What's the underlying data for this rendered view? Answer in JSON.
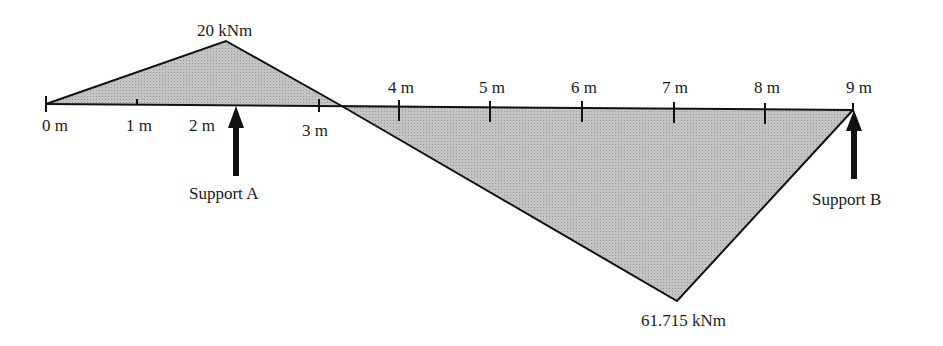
{
  "diagram": {
    "type": "bending-moment-diagram",
    "beam": {
      "start_m": 0,
      "end_m": 9,
      "tick_labels": [
        "0 m",
        "1 m",
        "2 m",
        "3 m",
        "4 m",
        "5 m",
        "6 m",
        "7 m",
        "8 m",
        "9 m"
      ]
    },
    "peaks": {
      "positive": {
        "label": "20 kNm",
        "value_kNm": 20
      },
      "negative": {
        "label": "61.715 kNm",
        "value_kNm": -61.715
      }
    },
    "supports": [
      {
        "label": "Support A"
      },
      {
        "label": "Support B"
      }
    ],
    "colors": {
      "fill": "#bdbdbd",
      "line": "#111111",
      "arrow": "#111111"
    }
  }
}
